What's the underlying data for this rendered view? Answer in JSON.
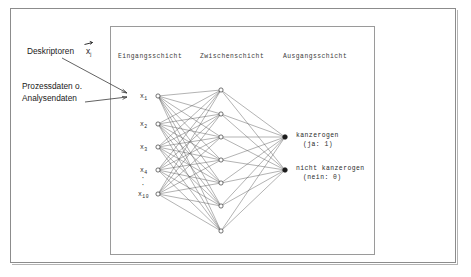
{
  "figure": {
    "type": "neural-network-diagram",
    "language": "de",
    "background_color": "#ffffff",
    "frame_color": "#8c8c8c",
    "node_color_open": "#ffffff",
    "node_color_filled": "#1c1c1c",
    "edge_color": "#555555"
  },
  "annotations": {
    "descriptors": {
      "label": "Deskriptoren",
      "symbol": "x",
      "subscript": "j",
      "has_vector_arrow": true
    },
    "process_data": {
      "line1": "Prozessdaten o.",
      "line2": "Analysendaten"
    }
  },
  "layers": {
    "input": {
      "heading": "Eingangsschicht",
      "node_count": 5,
      "labels": [
        "x",
        "x",
        "x",
        "x",
        "x"
      ],
      "subscripts": [
        "1",
        "2",
        "3",
        "4",
        "10"
      ],
      "ellipsis": "·",
      "ellipsis_count": 2,
      "implied_total": 10
    },
    "hidden": {
      "heading": "Zwischenschicht",
      "node_count": 7
    },
    "output": {
      "heading": "Ausgangsschicht",
      "node_count": 2,
      "nodes": [
        {
          "label": "kanzerogen",
          "value_text": "(ja: 1)"
        },
        {
          "label": "nicht kanzerogen",
          "value_text": "(nein: 0)"
        }
      ]
    }
  }
}
